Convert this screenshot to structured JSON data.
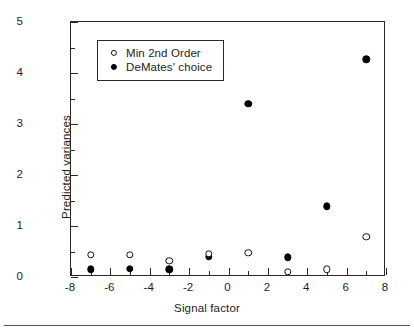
{
  "chart_data": {
    "type": "scatter",
    "title": "",
    "xlabel": "Signal factor",
    "ylabel": "Predicted variances",
    "xlim": [
      -8,
      8
    ],
    "ylim": [
      0,
      5
    ],
    "xticks": [
      -8,
      -6,
      -4,
      -2,
      0,
      2,
      4,
      6,
      8
    ],
    "xtick_labels": [
      "-8",
      "-6",
      "-4",
      "-2",
      "0",
      "2",
      "4",
      "6",
      "8"
    ],
    "yticks": [
      0,
      1,
      2,
      3,
      4,
      5
    ],
    "ytick_labels": [
      "0",
      "1",
      "2",
      "3",
      "4",
      "5"
    ],
    "x_minor_ticks": [
      -7,
      -5,
      -3,
      -1,
      1,
      3,
      5,
      7
    ],
    "y_minor_ticks": [
      0.5,
      1.5,
      2.5,
      3.5,
      4.5
    ],
    "grid": false,
    "legend_position": "upper left",
    "series": [
      {
        "name": "Min 2nd Order",
        "marker": "open-circle",
        "color": "#111111",
        "x": [
          -7,
          -5,
          -3,
          -1,
          1,
          3,
          5,
          7
        ],
        "y": [
          0.43,
          0.43,
          0.32,
          0.46,
          0.47,
          0.1,
          0.15,
          0.79
        ]
      },
      {
        "name": "DeMates' choice",
        "marker": "filled-circle",
        "color": "#000000",
        "x": [
          -7,
          -5,
          -3,
          -1,
          1,
          3,
          5,
          7
        ],
        "y": [
          0.15,
          0.16,
          0.15,
          0.4,
          3.4,
          0.39,
          1.39,
          4.27
        ]
      }
    ]
  },
  "legend": {
    "entries": [
      {
        "label": "Min 2nd Order",
        "marker": "open-circle"
      },
      {
        "label": "DeMates' choice",
        "marker": "filled-circle"
      }
    ]
  }
}
